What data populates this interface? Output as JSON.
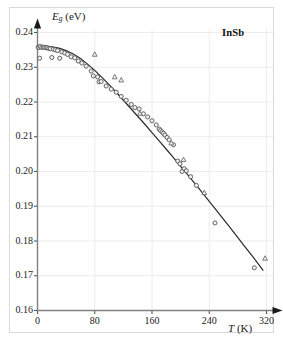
{
  "figure": {
    "material_label": "InSb",
    "background_color": "#ffffff",
    "frame_color": "#d9d9d9"
  },
  "axes": {
    "y_axis_label_main": "E",
    "y_axis_label_sub": "g",
    "y_axis_label_unit": " (eV)",
    "x_axis_label_main": "T",
    "x_axis_label_unit": " (K)",
    "y_ticks": [
      "0.16",
      "0.17",
      "0.18",
      "0.19",
      "0.20",
      "0.21",
      "0.22",
      "0.23",
      "0.24"
    ],
    "x_ticks": [
      "0",
      "80",
      "160",
      "240",
      "320"
    ]
  },
  "chart_data": {
    "type": "scatter",
    "title": "",
    "subtitle": "",
    "xlabel": "T (K)",
    "ylabel": "Eg (eV)",
    "xlim": [
      0,
      320
    ],
    "ylim": [
      0.16,
      0.24
    ],
    "xticks": [
      0,
      80,
      160,
      240,
      320
    ],
    "yticks": [
      0.16,
      0.17,
      0.18,
      0.19,
      0.2,
      0.21,
      0.22,
      0.23,
      0.24
    ],
    "grid": true,
    "grid_color": "#ececec",
    "legend": "none",
    "annotations": [
      {
        "text": "InSb",
        "x": 272,
        "y": 0.2365
      }
    ],
    "series": [
      {
        "name": "experimental-circles",
        "marker": "circle-open",
        "color": "#555555",
        "points": [
          [
            1,
            0.2358
          ],
          [
            2,
            0.2357
          ],
          [
            3,
            0.2326
          ],
          [
            4,
            0.236
          ],
          [
            6,
            0.2357
          ],
          [
            8,
            0.2358
          ],
          [
            10,
            0.2357
          ],
          [
            12,
            0.2356
          ],
          [
            14,
            0.2356
          ],
          [
            16,
            0.2354
          ],
          [
            18,
            0.2353
          ],
          [
            20,
            0.2328
          ],
          [
            22,
            0.2352
          ],
          [
            25,
            0.235
          ],
          [
            28,
            0.2348
          ],
          [
            31,
            0.2326
          ],
          [
            34,
            0.2344
          ],
          [
            38,
            0.2341
          ],
          [
            42,
            0.2337
          ],
          [
            47,
            0.233
          ],
          [
            52,
            0.2327
          ],
          [
            57,
            0.2318
          ],
          [
            62,
            0.2312
          ],
          [
            68,
            0.2303
          ],
          [
            75,
            0.2289
          ],
          [
            78,
            0.2275
          ],
          [
            84,
            0.2272
          ],
          [
            86,
            0.2258
          ],
          [
            89,
            0.2259
          ],
          [
            96,
            0.2246
          ],
          [
            103,
            0.2237
          ],
          [
            110,
            0.2228
          ],
          [
            117,
            0.2216
          ],
          [
            124,
            0.2205
          ],
          [
            131,
            0.2193
          ],
          [
            136,
            0.2184
          ],
          [
            142,
            0.218
          ],
          [
            148,
            0.2166
          ],
          [
            154,
            0.2157
          ],
          [
            160,
            0.2146
          ],
          [
            166,
            0.2134
          ],
          [
            170,
            0.2122
          ],
          [
            172,
            0.2118
          ],
          [
            174,
            0.2114
          ],
          [
            176,
            0.211
          ],
          [
            178,
            0.2105
          ],
          [
            181,
            0.2098
          ],
          [
            184,
            0.2091
          ],
          [
            190,
            0.2077
          ],
          [
            196,
            0.203
          ],
          [
            199,
            0.2022
          ],
          [
            202,
            0.2
          ],
          [
            205,
            0.2008
          ],
          [
            208,
            0.2002
          ],
          [
            214,
            0.1985
          ],
          [
            222,
            0.196
          ],
          [
            248,
            0.1852
          ],
          [
            303,
            0.1723
          ]
        ]
      },
      {
        "name": "experimental-triangles",
        "marker": "triangle-open",
        "color": "#666666",
        "points": [
          [
            80,
            0.2337
          ],
          [
            108,
            0.2272
          ],
          [
            117,
            0.2263
          ],
          [
            143,
            0.2167
          ],
          [
            187,
            0.2082
          ],
          [
            204,
            0.2034
          ],
          [
            233,
            0.1939
          ],
          [
            318,
            0.175
          ]
        ]
      }
    ],
    "fit_curve": {
      "name": "varshni-fit",
      "color": "#2a2a2a",
      "points": [
        [
          0,
          0.2362
        ],
        [
          10,
          0.2361
        ],
        [
          20,
          0.2359
        ],
        [
          30,
          0.2355
        ],
        [
          40,
          0.2348
        ],
        [
          50,
          0.2338
        ],
        [
          60,
          0.2325
        ],
        [
          70,
          0.2309
        ],
        [
          80,
          0.2291
        ],
        [
          90,
          0.2271
        ],
        [
          100,
          0.225
        ],
        [
          110,
          0.2228
        ],
        [
          120,
          0.2205
        ],
        [
          130,
          0.2182
        ],
        [
          140,
          0.2159
        ],
        [
          150,
          0.2136
        ],
        [
          160,
          0.2112
        ],
        [
          170,
          0.2088
        ],
        [
          180,
          0.2064
        ],
        [
          190,
          0.204
        ],
        [
          200,
          0.2015
        ],
        [
          210,
          0.199
        ],
        [
          220,
          0.1965
        ],
        [
          230,
          0.194
        ],
        [
          240,
          0.1914
        ],
        [
          250,
          0.1888
        ],
        [
          260,
          0.1862
        ],
        [
          270,
          0.1836
        ],
        [
          280,
          0.181
        ],
        [
          290,
          0.1783
        ],
        [
          300,
          0.1757
        ],
        [
          310,
          0.173
        ],
        [
          315,
          0.1716
        ]
      ]
    }
  }
}
